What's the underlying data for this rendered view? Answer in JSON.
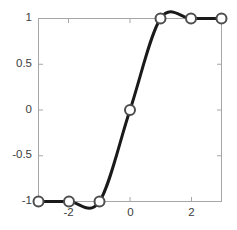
{
  "chart_data": {
    "type": "line",
    "title": "",
    "subtitle": "",
    "xlabel": "",
    "ylabel": "",
    "x": [
      -3,
      -2,
      -1,
      0,
      1,
      2,
      3
    ],
    "values": [
      -1,
      -1,
      -1,
      0,
      1,
      1,
      1
    ],
    "series": [
      {
        "name": "step",
        "x": [
          -3,
          -2,
          -1,
          0,
          1,
          2,
          3
        ],
        "values": [
          -1,
          -1,
          -1,
          0,
          1,
          1,
          1
        ]
      }
    ],
    "xlim": [
      -3,
      3
    ],
    "ylim": [
      -1,
      1
    ],
    "xticks": [
      -2,
      0,
      2
    ],
    "xtick_labels": [
      "-2",
      "0",
      "2"
    ],
    "yticks": [
      -1,
      -0.5,
      0,
      0.5,
      1
    ],
    "ytick_labels": [
      "-1",
      "-0.5",
      "0",
      "0.5",
      "1"
    ],
    "grid": false,
    "legend": null,
    "legend_position": "none",
    "marker": "circle-open",
    "line_color": "#1a1a1a",
    "marker_edge_color": "#4d4d4d",
    "marker_face_color": "#ffffff",
    "axis_color": "#a6a6a6",
    "background_color": "#ffffff",
    "annotations": []
  },
  "axes": {
    "y_labels": [
      "1",
      "0.5",
      "0",
      "-0.5",
      "-1"
    ],
    "x_labels": [
      "-2",
      "0",
      "2"
    ]
  }
}
